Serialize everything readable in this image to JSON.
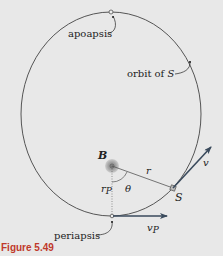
{
  "figure": {
    "caption": "Figure 5.49",
    "labels": {
      "apoapsis": "apoapsis",
      "orbit": "orbit of ",
      "orbit_var": "S",
      "body": "B",
      "satellite": "S",
      "radius": "r",
      "periapsis_radius": "r",
      "periapsis_radius_sub": "P",
      "angle": "θ",
      "velocity": "v",
      "periapsis_velocity": "v",
      "periapsis_velocity_sub": "P",
      "periapsis": "periapsis"
    },
    "colors": {
      "background": "#e8e8e8",
      "orbit": "#555555",
      "arrow": "#3a4a5c",
      "caption": "#c0392b",
      "body_fill": "#9a9a9a"
    }
  }
}
